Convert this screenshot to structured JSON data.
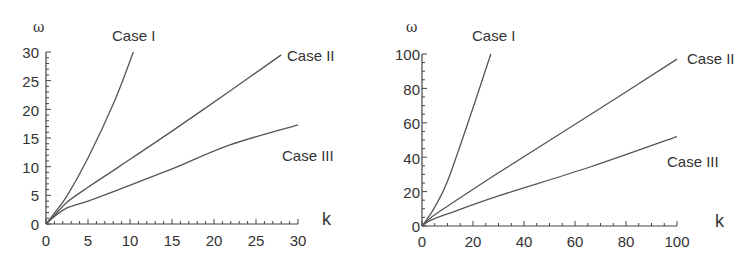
{
  "chart_data": [
    {
      "type": "line",
      "title": "",
      "xlabel": "k",
      "ylabel": "ω",
      "xlim": [
        0,
        30
      ],
      "ylim": [
        0,
        30
      ],
      "xticks": [
        0,
        5,
        10,
        15,
        20,
        25,
        30
      ],
      "yticks": [
        0,
        5,
        10,
        15,
        20,
        25,
        30
      ],
      "minor_ticks_per_major": 5,
      "grid": false,
      "legend": "inline labels",
      "series": [
        {
          "name": "Case I",
          "x": [
            0,
            1,
            2.5,
            5,
            8.2,
            10.4
          ],
          "y": [
            0,
            1.9,
            4.9,
            11.5,
            21.6,
            30
          ]
        },
        {
          "name": "Case II",
          "x": [
            0,
            1,
            2.5,
            5,
            8.8,
            15,
            21.9,
            28
          ],
          "y": [
            0,
            1.5,
            3.8,
            6.4,
            10.1,
            16.2,
            23.2,
            29.5
          ]
        },
        {
          "name": "Case III",
          "x": [
            0,
            1,
            2.5,
            5,
            8.8,
            15,
            21.9,
            30
          ],
          "y": [
            0,
            1.3,
            2.8,
            4.0,
            6.1,
            9.6,
            13.8,
            17.3
          ]
        }
      ],
      "annotations": [
        {
          "text": "Case I",
          "x": 7.8,
          "y": 32.5
        },
        {
          "text": "Case II",
          "x": 28.9,
          "y": 29.5
        },
        {
          "text": "Case III",
          "x": 28.7,
          "y": 15.0
        }
      ]
    },
    {
      "type": "line",
      "title": "",
      "xlabel": "k",
      "ylabel": "ω",
      "xlim": [
        0,
        100
      ],
      "ylim": [
        0,
        100
      ],
      "xticks": [
        0,
        20,
        40,
        60,
        80,
        100
      ],
      "yticks": [
        0,
        20,
        40,
        60,
        80,
        100
      ],
      "minor_ticks_per_major": 4,
      "grid": false,
      "legend": "inline labels",
      "series": [
        {
          "name": "Case I",
          "x": [
            0,
            2,
            5,
            10,
            18.4,
            27
          ],
          "y": [
            0,
            4,
            11,
            26,
            61.6,
            100
          ]
        },
        {
          "name": "Case II",
          "x": [
            0,
            2,
            5,
            10,
            30,
            62.7,
            100
          ],
          "y": [
            0,
            3,
            6.5,
            11.5,
            31,
            61.6,
            97
          ]
        },
        {
          "name": "Case III",
          "x": [
            0,
            2,
            5,
            10,
            30,
            65.9,
            100
          ],
          "y": [
            0,
            2.2,
            4.3,
            7,
            17.5,
            34.3,
            52
          ]
        }
      ],
      "annotations": [
        {
          "text": "Case I",
          "x": 19.5,
          "y": 110
        },
        {
          "text": "Case II",
          "x": 103,
          "y": 97
        },
        {
          "text": "Case III",
          "x": 92,
          "y": 42
        }
      ]
    }
  ],
  "charts": [
    {
      "ylabel": "ω",
      "xlabel": "k",
      "yticks": [
        "0",
        "5",
        "10",
        "15",
        "20",
        "25",
        "30"
      ],
      "xticks": [
        "0",
        "5",
        "10",
        "15",
        "20",
        "25",
        "30"
      ],
      "labels": {
        "case1": "Case I",
        "case2": "Case II",
        "case3": "Case III"
      }
    },
    {
      "ylabel": "ω",
      "xlabel": "k",
      "yticks": [
        "0",
        "20",
        "40",
        "60",
        "80",
        "100"
      ],
      "xticks": [
        "0",
        "20",
        "40",
        "60",
        "80",
        "100"
      ],
      "labels": {
        "case1": "Case I",
        "case2": "Case II",
        "case3": "Case III"
      }
    }
  ],
  "colors": {
    "axis": "#444444",
    "curve": "#555555",
    "text": "#333333"
  }
}
